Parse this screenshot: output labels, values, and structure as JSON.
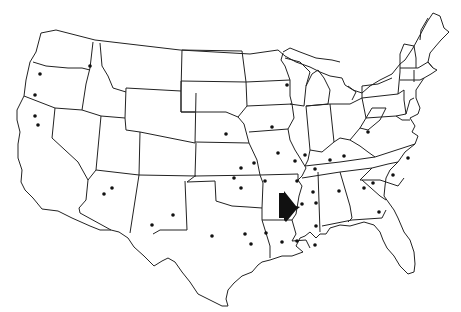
{
  "map": {
    "type": "outline-map",
    "region": "Contiguous United States",
    "style": "black-and-white state outlines",
    "colors": {
      "background": "#ffffff",
      "outline": "#222222",
      "marker": "#111111",
      "arrow": "#111111"
    },
    "arrow": {
      "icon": "right-pointing-arrow-icon",
      "points_to": "Mississippi River, Arkansas–Mississippi border",
      "position": [
        287,
        206
      ]
    },
    "markers": [
      {
        "x": 40,
        "y": 74
      },
      {
        "x": 35,
        "y": 95
      },
      {
        "x": 35,
        "y": 116
      },
      {
        "x": 38,
        "y": 125
      },
      {
        "x": 90,
        "y": 66
      },
      {
        "x": 112,
        "y": 216
      },
      {
        "x": 104,
        "y": 194
      },
      {
        "x": 151,
        "y": 225
      },
      {
        "x": 173,
        "y": 215
      },
      {
        "x": 226,
        "y": 134
      },
      {
        "x": 242,
        "y": 234
      },
      {
        "x": 210,
        "y": 236
      },
      {
        "x": 287,
        "y": 85
      },
      {
        "x": 272,
        "y": 127
      },
      {
        "x": 278,
        "y": 153
      },
      {
        "x": 305,
        "y": 155
      },
      {
        "x": 312,
        "y": 144
      },
      {
        "x": 234,
        "y": 178
      },
      {
        "x": 246,
        "y": 199
      },
      {
        "x": 266,
        "y": 180
      },
      {
        "x": 254,
        "y": 163
      },
      {
        "x": 265,
        "y": 157
      },
      {
        "x": 292,
        "y": 181
      },
      {
        "x": 298,
        "y": 165
      },
      {
        "x": 315,
        "y": 180
      },
      {
        "x": 330,
        "y": 160
      },
      {
        "x": 344,
        "y": 156
      },
      {
        "x": 369,
        "y": 132
      },
      {
        "x": 391,
        "y": 136
      },
      {
        "x": 409,
        "y": 121
      },
      {
        "x": 313,
        "y": 193
      },
      {
        "x": 315,
        "y": 202
      },
      {
        "x": 339,
        "y": 191
      },
      {
        "x": 357,
        "y": 188
      },
      {
        "x": 370,
        "y": 178
      },
      {
        "x": 392,
        "y": 175
      },
      {
        "x": 375,
        "y": 183
      },
      {
        "x": 380,
        "y": 212
      },
      {
        "x": 364,
        "y": 225
      },
      {
        "x": 312,
        "y": 229
      },
      {
        "x": 317,
        "y": 211
      },
      {
        "x": 284,
        "y": 241
      },
      {
        "x": 297,
        "y": 242
      },
      {
        "x": 256,
        "y": 254
      },
      {
        "x": 266,
        "y": 241
      },
      {
        "x": 276,
        "y": 189
      },
      {
        "x": 302,
        "y": 202
      },
      {
        "x": 258,
        "y": 244
      },
      {
        "x": 243,
        "y": 239
      }
    ]
  }
}
